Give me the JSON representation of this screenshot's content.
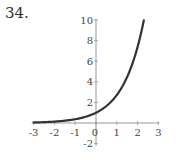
{
  "problem_number": "34.",
  "chart_data": {
    "type": "line",
    "title": "",
    "xlabel": "",
    "ylabel": "",
    "function": "y = e^x",
    "xlim": [
      -3,
      3
    ],
    "ylim": [
      -2,
      10
    ],
    "grid": false,
    "legend": null,
    "x_ticks": [
      "-3",
      "-2",
      "-1",
      "0",
      "1",
      "2",
      "3"
    ],
    "y_ticks": [
      "-2",
      "2",
      "4",
      "6",
      "8",
      "10"
    ],
    "series": [
      {
        "name": "e^x",
        "color": "#333333",
        "x": [
          -3,
          -2.5,
          -2,
          -1.5,
          -1,
          -0.5,
          0,
          0.5,
          1,
          1.5,
          2,
          2.3
        ],
        "y": [
          0.05,
          0.08,
          0.14,
          0.22,
          0.37,
          0.61,
          1.0,
          1.65,
          2.72,
          4.48,
          7.39,
          9.97
        ]
      }
    ]
  }
}
